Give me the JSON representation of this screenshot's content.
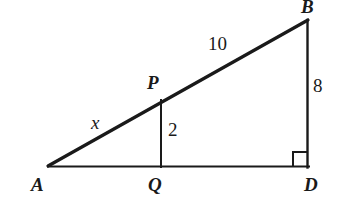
{
  "figure": {
    "background_color": "#ffffff",
    "stroke_color": "#1a1a1a",
    "width": 346,
    "height": 222
  },
  "vertices": {
    "A": {
      "label": "A",
      "x": 48,
      "y": 166
    },
    "B": {
      "label": "B",
      "x": 308,
      "y": 20
    },
    "D": {
      "label": "D",
      "x": 308,
      "y": 167
    },
    "P": {
      "label": "P",
      "x": 161,
      "y": 101
    },
    "Q": {
      "label": "Q",
      "x": 161,
      "y": 167
    }
  },
  "measures": {
    "hypotenuse_upper": "10",
    "hypotenuse_lower": "x",
    "altitude_small": "2",
    "leg_right": "8"
  },
  "segments": {
    "base_AD": "A to D",
    "leg_BD": "B to D",
    "hypotenuse_AB": "A to B",
    "altitude_PQ": "P to Q"
  },
  "markers": {
    "right_angle_at_D": "right-angle-square"
  }
}
